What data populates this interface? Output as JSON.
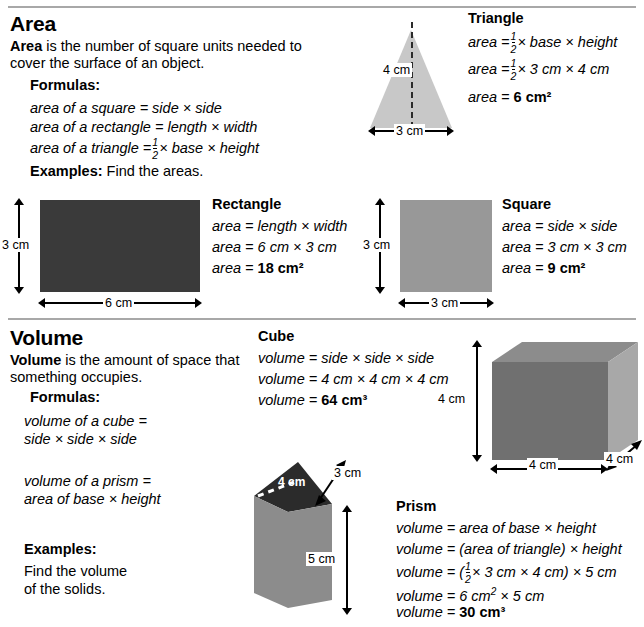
{
  "sections": {
    "area": {
      "title": "Area",
      "definition_lead": "Area",
      "definition_rest": " is the number of square units needed to cover the surface of an object.",
      "formulas_label": "Formulas:",
      "formulas": [
        "area of a square = side × side",
        "area of a rectangle = length × width",
        "area of a triangle = ½ × base × height"
      ],
      "examples_lead": "Examples:",
      "examples_rest": " Find the areas.",
      "triangle": {
        "heading": "Triangle",
        "line1_prefix": "area",
        "line1_rest": "× base × height",
        "line2_prefix": "area",
        "line2_rest": "× 3 cm × 4 cm",
        "line3_prefix": "area =",
        "line3_answer": "6 cm²",
        "height_label": "4 cm",
        "base_label": "3 cm"
      },
      "rectangle": {
        "heading": "Rectangle",
        "line1": "area = length × width",
        "line2": "area = 6 cm × 3 cm",
        "line3_prefix": "area =",
        "line3_answer": "18 cm²",
        "height_label": "3 cm",
        "width_label": "6 cm"
      },
      "square": {
        "heading": "Square",
        "line1": "area = side × side",
        "line2": "area = 3 cm × 3 cm",
        "line3_prefix": "area =",
        "line3_answer": "9 cm²",
        "height_label": "3 cm",
        "width_label": "3 cm"
      }
    },
    "volume": {
      "title": "Volume",
      "definition_lead": "Volume",
      "definition_rest": " is the amount of space that something occupies.",
      "formulas_label": "Formulas:",
      "formula_cube_l1": "volume of a cube =",
      "formula_cube_l2": "side × side × side",
      "formula_prism_l1": "volume of a prism =",
      "formula_prism_l2": "area of base × height",
      "examples_label": "Examples:",
      "examples_l1": "Find the volume",
      "examples_l2": "of the solids.",
      "cube": {
        "heading": "Cube",
        "line1": "volume = side × side × side",
        "line2": "volume = 4 cm × 4 cm × 4 cm",
        "line3_prefix": "volume =",
        "line3_answer": "64 cm³",
        "height_label": "4 cm",
        "width_label": "4 cm",
        "depth_label": "4 cm"
      },
      "prism": {
        "heading": "Prism",
        "line1": "volume = area of base × height",
        "line2": "volume = (area of triangle) × height",
        "line3_prefix": "volume = (",
        "line3_mid": "× 3 cm × 4 cm) × 5 cm",
        "line4_prefix": "volume = 6 cm",
        "line4_rest": " × 5 cm",
        "line5_prefix": "volume =",
        "line5_answer": "30 cm³",
        "base_label": "4 cm",
        "slant_label": "3 cm",
        "height_label": "5 cm"
      }
    }
  },
  "colors": {
    "rule": "#a8a8a8",
    "triangle_fill": "#c8c8c8",
    "rectangle_fill": "#3a3a3a",
    "square_fill": "#989898",
    "cube_front": "#707070",
    "cube_top": "#8c8c8c",
    "cube_side": "#a8a8a8",
    "prism_top": "#2b2b2b",
    "prism_front": "#8c8c8c"
  }
}
